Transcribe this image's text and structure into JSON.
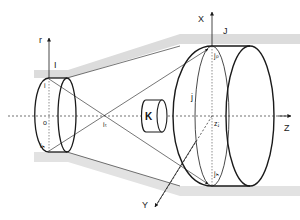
{
  "diagram": {
    "type": "optical projection geometry diagram",
    "colors": {
      "line": "#1a1a1a",
      "shade": "#d9d9d9",
      "background": "#ffffff"
    },
    "axes": {
      "r": "r",
      "X": "X",
      "Y": "Y",
      "Z": "Z"
    },
    "labels": {
      "I": "I",
      "i": "i",
      "o": "o",
      "ih": "iₕ",
      "it": "iₜ",
      "K": "K",
      "J": "J",
      "j": "j",
      "jp": "jₚ",
      "zj": "zⱼ",
      "jh": "jₕ"
    }
  }
}
